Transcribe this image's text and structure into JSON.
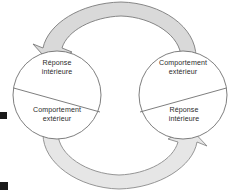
{
  "figure": {
    "type": "cycle-diagram",
    "language": "fr",
    "left_circle": {
      "top_sector_label": "Réponse\nintérieure",
      "top_sector_line1": "Réponse",
      "top_sector_line2": "intérieure",
      "bottom_sector_line1": "Comportement",
      "bottom_sector_line2": "extérieur"
    },
    "right_circle": {
      "top_sector_line1": "Comportement",
      "top_sector_line2": "extérieur",
      "bottom_sector_line1": "Réponse",
      "bottom_sector_line2": "intérieure"
    },
    "arrows": {
      "top_arrow_direction": "right-to-left",
      "bottom_arrow_direction": "left-to-right"
    },
    "colors": {
      "band_fill_dark": "#d9d9d9",
      "band_fill_light": "#e6e6e6",
      "outline": "#6f6f6f",
      "background": "#ffffff",
      "text": "#2b2b2b",
      "edge_mark": "#1a1a1a"
    }
  }
}
